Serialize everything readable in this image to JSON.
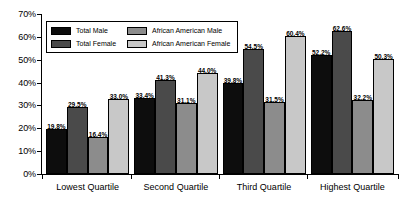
{
  "chart_data": {
    "type": "bar",
    "title": "",
    "xlabel": "",
    "ylabel": "",
    "ylim": [
      0,
      70
    ],
    "ytick_labels": [
      "0%",
      "10%",
      "20%",
      "30%",
      "40%",
      "50%",
      "60%",
      "70%"
    ],
    "ytick_values": [
      0,
      10,
      20,
      30,
      40,
      50,
      60,
      70
    ],
    "grid": false,
    "legend_position": "upper-left-inside",
    "categories": [
      "Lowest Quartile",
      "Second Quartile",
      "Third Quartile",
      "Highest Quartile"
    ],
    "series": [
      {
        "name": "Total Male",
        "color": "#0d0d0d",
        "values": [
          19.8,
          33.4,
          39.8,
          52.2
        ],
        "labels": [
          "19.8%",
          "33.4%",
          "39.8%",
          "52.2%"
        ]
      },
      {
        "name": "Total Female",
        "color": "#4a4a4a",
        "values": [
          29.5,
          41.3,
          54.5,
          62.6
        ],
        "labels": [
          "29.5%",
          "41.3%",
          "54.5%",
          "62.6%"
        ]
      },
      {
        "name": "African American Male",
        "color": "#8c8c8c",
        "values": [
          16.4,
          31.1,
          31.5,
          32.2
        ],
        "labels": [
          "16.4%",
          "31.1%",
          "31.5%",
          "32.2%"
        ]
      },
      {
        "name": "African American Female",
        "color": "#c8c8c8",
        "values": [
          33.0,
          44.0,
          60.4,
          50.3
        ],
        "labels": [
          "33.0%",
          "44.0%",
          "60.4%",
          "50.3%"
        ]
      }
    ]
  },
  "legend": {
    "entries": [
      {
        "label": "Total Male",
        "color": "#0d0d0d"
      },
      {
        "label": "African American Male",
        "color": "#8c8c8c"
      },
      {
        "label": "Total Female",
        "color": "#4a4a4a"
      },
      {
        "label": "African American Female",
        "color": "#c8c8c8"
      }
    ]
  },
  "colors": {
    "axis": "#000000",
    "background": "#ffffff",
    "text": "#000000"
  }
}
